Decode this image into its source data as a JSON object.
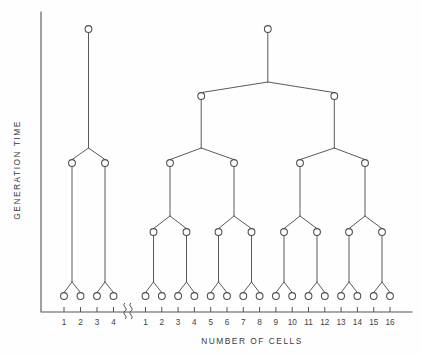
{
  "figure": {
    "kind": "cell-lineage-binary-tree-diagram",
    "background_color": "#fefefe",
    "ink_color": "#4d4d4d"
  },
  "axes": {
    "y_axis_title": "GENERATION  TIME",
    "x_axis_title": "NUMBER   OF   CELLS",
    "y_axis_line": {
      "x": 41,
      "y_top": 12,
      "y_bottom": 312
    },
    "x_axis_line": {
      "y": 312,
      "x_left": 41,
      "x_right": 412
    },
    "axis_break_symbol": "≋",
    "axis_break_x": 130,
    "left_group_ticks": [
      "1",
      "2",
      "3",
      "4"
    ],
    "right_group_ticks": [
      "1",
      "2",
      "3",
      "4",
      "5",
      "6",
      "7",
      "8",
      "9",
      "10",
      "11",
      "12",
      "13",
      "14",
      "15",
      "16"
    ]
  },
  "chart_data": {
    "type": "diagram",
    "title": "",
    "xlabel": "NUMBER   OF   CELLS",
    "ylabel": "GENERATION  TIME",
    "grid": false,
    "legend": "none",
    "trees": [
      {
        "name": "left-tree",
        "generations": 2,
        "leaf_count": 4,
        "leaf_labels": [
          "1",
          "2",
          "3",
          "4"
        ],
        "leaf_x": [
          64,
          80.5,
          97,
          113.5
        ],
        "leaf_y": 296,
        "root": {
          "x": 88.5,
          "y": 29
        },
        "levels": [
          {
            "generation": 0,
            "y": 29,
            "nodes_x": [
              88.5
            ]
          },
          {
            "generation": 1,
            "y": 163,
            "nodes_x": [
              72,
              105
            ]
          },
          {
            "generation": 2,
            "y": 296,
            "nodes_x": [
              64,
              80.5,
              97,
              113.5
            ]
          }
        ],
        "fork_y": [
          148,
          282
        ]
      },
      {
        "name": "right-tree",
        "generations": 4,
        "leaf_count": 16,
        "leaf_labels": [
          "1",
          "2",
          "3",
          "4",
          "5",
          "6",
          "7",
          "8",
          "9",
          "10",
          "11",
          "12",
          "13",
          "14",
          "15",
          "16"
        ],
        "leaf_x": [
          145.5,
          161.8,
          178.1,
          194.4,
          210.7,
          227,
          243.3,
          259.6,
          275.9,
          292.2,
          308.5,
          324.8,
          341.1,
          357.4,
          373.7,
          390
        ],
        "leaf_y": 296,
        "root": {
          "x": 267.8,
          "y": 29
        },
        "levels": [
          {
            "generation": 0,
            "y": 29,
            "nodes_x": [
              267.8
            ]
          },
          {
            "generation": 1,
            "y": 96,
            "nodes_x": [
              201.2,
              334.3
            ]
          },
          {
            "generation": 2,
            "y": 163,
            "nodes_x": [
              170,
              234,
              300,
              365
            ]
          },
          {
            "generation": 3,
            "y": 232,
            "nodes_x": [
              153.5,
              186.5,
              218.5,
              251.5,
              284,
              317,
              349,
              382
            ]
          },
          {
            "generation": 4,
            "y": 296,
            "nodes_x": [
              145.5,
              161.8,
              178.1,
              194.4,
              210.7,
              227,
              243.3,
              259.6,
              275.9,
              292.2,
              308.5,
              324.8,
              341.1,
              357.4,
              373.7,
              390
            ]
          }
        ],
        "fork_y": [
          82,
          148,
          216,
          282
        ]
      }
    ],
    "node_radius": 3.4
  }
}
